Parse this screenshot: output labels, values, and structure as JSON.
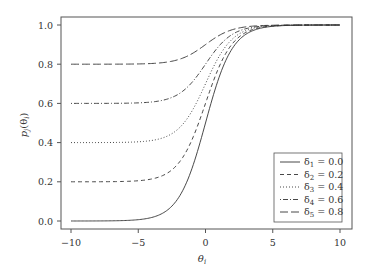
{
  "chart_data": {
    "type": "line",
    "title": "",
    "xlabel": "θi",
    "ylabel": "pj(θi)",
    "xlim": [
      -10,
      10
    ],
    "ylim": [
      0,
      1
    ],
    "xticks": [
      "−10",
      "−5",
      "0",
      "5",
      "10"
    ],
    "yticks": [
      "0.0",
      "0.2",
      "0.4",
      "0.6",
      "0.8",
      "1.0"
    ],
    "grid": false,
    "legend_position": "lower right",
    "x": [
      -10,
      -9,
      -8,
      -7,
      -6,
      -5,
      -4,
      -3,
      -2,
      -1,
      0,
      1,
      2,
      3,
      4,
      5,
      6,
      7,
      8,
      9,
      10
    ],
    "series": [
      {
        "name": "δ1 = 0.0",
        "style": "solid",
        "values": [
          0.0,
          0.0,
          0.0,
          0.001,
          0.002,
          0.007,
          0.018,
          0.047,
          0.119,
          0.269,
          0.5,
          0.731,
          0.881,
          0.953,
          0.982,
          0.993,
          0.998,
          0.999,
          1.0,
          1.0,
          1.0
        ]
      },
      {
        "name": "δ2 = 0.2",
        "style": "dashed",
        "values": [
          0.2,
          0.2,
          0.2,
          0.201,
          0.202,
          0.205,
          0.214,
          0.238,
          0.295,
          0.415,
          0.6,
          0.785,
          0.905,
          0.962,
          0.986,
          0.995,
          0.998,
          0.999,
          1.0,
          1.0,
          1.0
        ]
      },
      {
        "name": "δ3 = 0.4",
        "style": "dotted",
        "values": [
          0.4,
          0.4,
          0.4,
          0.401,
          0.401,
          0.404,
          0.411,
          0.428,
          0.471,
          0.561,
          0.7,
          0.839,
          0.929,
          0.972,
          0.989,
          0.996,
          0.999,
          0.999,
          1.0,
          1.0,
          1.0
        ]
      },
      {
        "name": "δ4 = 0.6",
        "style": "dotdash",
        "values": [
          0.6,
          0.6,
          0.6,
          0.6,
          0.601,
          0.603,
          0.607,
          0.619,
          0.648,
          0.708,
          0.8,
          0.892,
          0.952,
          0.981,
          0.993,
          0.997,
          0.999,
          1.0,
          1.0,
          1.0,
          1.0
        ]
      },
      {
        "name": "δ5 = 0.8",
        "style": "longdash",
        "values": [
          0.8,
          0.8,
          0.8,
          0.8,
          0.8,
          0.801,
          0.804,
          0.809,
          0.824,
          0.854,
          0.9,
          0.946,
          0.976,
          0.991,
          0.996,
          0.999,
          1.0,
          1.0,
          1.0,
          1.0,
          1.0
        ]
      }
    ]
  },
  "legend": {
    "entries": [
      {
        "symbol": "δ",
        "sub": "1",
        "value": "= 0.0"
      },
      {
        "symbol": "δ",
        "sub": "2",
        "value": "= 0.2"
      },
      {
        "symbol": "δ",
        "sub": "3",
        "value": "= 0.4"
      },
      {
        "symbol": "δ",
        "sub": "4",
        "value": "= 0.6"
      },
      {
        "symbol": "δ",
        "sub": "5",
        "value": "= 0.8"
      }
    ]
  },
  "axes": {
    "x_label_main": "θ",
    "x_label_sub": "i",
    "y_label_p": "p",
    "y_label_sub": "j",
    "y_label_rest": "(θ",
    "y_label_sub2": "i",
    "y_label_close": ")"
  }
}
